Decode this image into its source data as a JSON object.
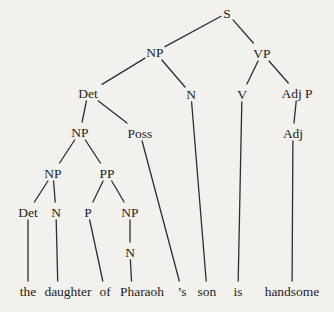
{
  "figure": {
    "type": "syntax-tree-diagram",
    "background_color": "#f2f1ee",
    "ink_color": "#1e1e1e",
    "line_color": "#2e2e2e",
    "sentence": "the daughter of Pharaoh ’s son is handsome"
  },
  "tree": {
    "nodes": [
      {
        "id": "S",
        "label": "S",
        "x": 227,
        "y": 13
      },
      {
        "id": "NP1",
        "label": "NP",
        "x": 155,
        "y": 52
      },
      {
        "id": "VP",
        "label": "VP",
        "x": 262,
        "y": 53
      },
      {
        "id": "Det1",
        "label": "Det",
        "x": 88,
        "y": 93
      },
      {
        "id": "N1",
        "label": "N",
        "x": 191,
        "y": 94
      },
      {
        "id": "V",
        "label": "V",
        "x": 242,
        "y": 94
      },
      {
        "id": "AdjP",
        "label": "Adj P",
        "x": 297,
        "y": 93
      },
      {
        "id": "NP2",
        "label": "NP",
        "x": 80,
        "y": 132
      },
      {
        "id": "Poss",
        "label": "Poss",
        "x": 140,
        "y": 133
      },
      {
        "id": "Adj",
        "label": "Adj",
        "x": 293,
        "y": 133
      },
      {
        "id": "NP3",
        "label": "NP",
        "x": 53,
        "y": 173
      },
      {
        "id": "PP",
        "label": "PP",
        "x": 107,
        "y": 173
      },
      {
        "id": "Det2",
        "label": "Det",
        "x": 28,
        "y": 212
      },
      {
        "id": "N2",
        "label": "N",
        "x": 56,
        "y": 212
      },
      {
        "id": "P",
        "label": "P",
        "x": 88,
        "y": 212
      },
      {
        "id": "NP4",
        "label": "NP",
        "x": 130,
        "y": 212
      },
      {
        "id": "N3",
        "label": "N",
        "x": 130,
        "y": 252
      },
      {
        "id": "w1",
        "label": "the",
        "x": 28,
        "y": 291,
        "terminal": true
      },
      {
        "id": "w2",
        "label": "daughter",
        "x": 68,
        "y": 291,
        "ax": 58,
        "terminal": true
      },
      {
        "id": "w3",
        "label": "of",
        "x": 105,
        "y": 291,
        "terminal": true
      },
      {
        "id": "w4",
        "label": "Pharaoh",
        "x": 142,
        "y": 291,
        "ax": 132,
        "terminal": true
      },
      {
        "id": "w5",
        "label": "’s",
        "x": 182,
        "y": 291,
        "terminal": true
      },
      {
        "id": "w6",
        "label": "son",
        "x": 207,
        "y": 291,
        "terminal": true
      },
      {
        "id": "w7",
        "label": "is",
        "x": 238,
        "y": 291,
        "terminal": true
      },
      {
        "id": "w8",
        "label": "handsome",
        "x": 292,
        "y": 291,
        "terminal": true
      }
    ],
    "edges": [
      {
        "from": "S",
        "to": "NP1"
      },
      {
        "from": "S",
        "to": "VP"
      },
      {
        "from": "NP1",
        "to": "Det1"
      },
      {
        "from": "NP1",
        "to": "N1"
      },
      {
        "from": "VP",
        "to": "V"
      },
      {
        "from": "VP",
        "to": "AdjP"
      },
      {
        "from": "Det1",
        "to": "NP2"
      },
      {
        "from": "Det1",
        "to": "Poss"
      },
      {
        "from": "AdjP",
        "to": "Adj"
      },
      {
        "from": "NP2",
        "to": "NP3"
      },
      {
        "from": "NP2",
        "to": "PP"
      },
      {
        "from": "NP3",
        "to": "Det2"
      },
      {
        "from": "NP3",
        "to": "N2"
      },
      {
        "from": "PP",
        "to": "P"
      },
      {
        "from": "PP",
        "to": "NP4"
      },
      {
        "from": "NP4",
        "to": "N3"
      },
      {
        "from": "Det2",
        "to": "w1"
      },
      {
        "from": "N2",
        "to": "w2"
      },
      {
        "from": "P",
        "to": "w3"
      },
      {
        "from": "N3",
        "to": "w4"
      },
      {
        "from": "Poss",
        "to": "w5"
      },
      {
        "from": "N1",
        "to": "w6"
      },
      {
        "from": "V",
        "to": "w7"
      },
      {
        "from": "Adj",
        "to": "w8"
      }
    ]
  }
}
